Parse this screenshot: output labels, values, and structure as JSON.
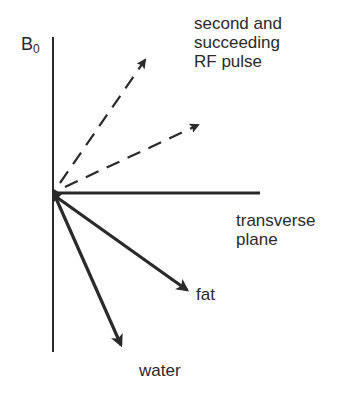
{
  "labels": {
    "b0_main": "B",
    "b0_sub": "0",
    "rf_line1": "second and",
    "rf_line2": "succeeding",
    "rf_line3": "RF pulse",
    "transverse_line1": "transverse",
    "transverse_line2": "plane",
    "fat": "fat",
    "water": "water"
  },
  "colors": {
    "ink": "#2a2a2a",
    "background": "#ffffff"
  },
  "geometry": {
    "origin": [
      54,
      193
    ],
    "vertical_axis": {
      "x": 53,
      "y_top": 37,
      "y_bottom": 352
    },
    "horizontal_axis": {
      "y": 193,
      "x_left": 53,
      "x_right": 260
    },
    "vectors": [
      {
        "name": "rf-vector-1",
        "style": "dashed",
        "tip": [
          146,
          58
        ]
      },
      {
        "name": "rf-vector-2",
        "style": "dashed",
        "tip": [
          200,
          124
        ]
      },
      {
        "name": "fat-vector",
        "style": "solid",
        "tip": [
          189,
          292
        ]
      },
      {
        "name": "water-vector",
        "style": "solid",
        "tip": [
          122,
          348
        ]
      }
    ]
  }
}
